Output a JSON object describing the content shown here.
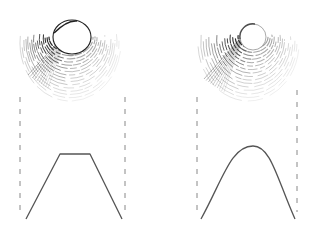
{
  "figure": {
    "background": "#ffffff",
    "ink_color": "#222222",
    "profile_color": "#555555",
    "dash_color": "#888888"
  },
  "panels": [
    {
      "id": "left",
      "name": "flat-top-cone",
      "surface": {
        "cap": {
          "cx": 72,
          "cy": 37,
          "rx": 19,
          "ry": 17,
          "apex": [
            77,
            21
          ]
        },
        "spread": {
          "x_min": 24,
          "x_max": 121,
          "y_top": 20,
          "y_bottom": 95
        },
        "shading": "dense dark left flank"
      },
      "dashed_guides": [
        {
          "x": 20,
          "y1": 97,
          "y2": 217
        },
        {
          "x": 125,
          "y1": 97,
          "y2": 217
        }
      ],
      "profile": {
        "shape": "trapezoid",
        "points": [
          [
            26,
            219
          ],
          [
            60,
            154
          ],
          [
            90,
            154
          ],
          [
            122,
            219
          ]
        ]
      }
    },
    {
      "id": "right",
      "name": "rounded-top-cone",
      "surface": {
        "cap": {
          "cx": 253,
          "cy": 37,
          "rx": 13,
          "ry": 13
        },
        "spread": {
          "x_min": 200,
          "x_max": 297,
          "y_top": 24,
          "y_bottom": 95
        },
        "shading": "dark left flank near cap"
      },
      "dashed_guides": [
        {
          "x": 197,
          "y1": 97,
          "y2": 217
        },
        {
          "x": 297,
          "y1": 90,
          "y2": 212
        }
      ],
      "profile": {
        "shape": "bell",
        "start": [
          201,
          219
        ],
        "peak": [
          253,
          146
        ],
        "end": [
          295,
          219
        ]
      }
    }
  ]
}
